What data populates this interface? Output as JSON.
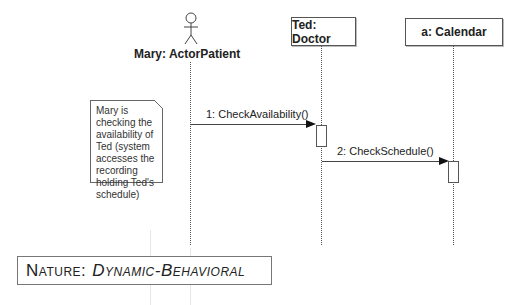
{
  "diagram": {
    "type": "UML sequence diagram",
    "participants": [
      {
        "id": "mary",
        "label": "Mary: ActorPatient",
        "kind": "actor"
      },
      {
        "id": "ted",
        "label": "Ted: Doctor",
        "kind": "object"
      },
      {
        "id": "calendar",
        "label": "a: Calendar",
        "kind": "object"
      }
    ],
    "messages": [
      {
        "label": "1: CheckAvailability()",
        "from": "mary",
        "to": "ted"
      },
      {
        "label": "2: CheckSchedule()",
        "from": "ted",
        "to": "calendar"
      }
    ],
    "note": {
      "lines": [
        "Mary is",
        "checking the",
        "availability of",
        "Ted (system",
        "accesses the",
        "recording",
        "holding Ted's",
        "schedule)"
      ]
    },
    "nature": {
      "key": "Nature:",
      "value": "Dynamic-Behavioral"
    }
  }
}
